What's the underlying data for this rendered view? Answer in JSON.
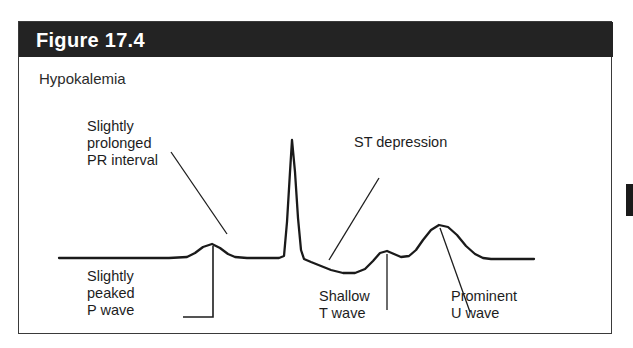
{
  "figure": {
    "title": "Figure 17.4",
    "condition": "Hypokalemia",
    "header_color": "#232323",
    "border_color": "#3a3a3a",
    "background_color": "#ffffff",
    "trace_color": "#1a1a1a",
    "text_color": "#1d1d1d",
    "title_color": "#ffffff"
  },
  "annotations": {
    "pr_interval": "Slightly\nprolonged\nPR interval",
    "st_depression": "ST depression",
    "p_wave": "Slightly\npeaked\nP wave",
    "t_wave": "Shallow\nT wave",
    "u_wave": "Prominent\nU wave"
  },
  "chart_data": {
    "type": "line",
    "title": "Figure 17.4",
    "subtitle": "Hypokalemia",
    "xlabel": "",
    "ylabel": "",
    "grid": false,
    "legend": "none",
    "baseline_y": 236,
    "x_range": [
      40,
      515
    ],
    "series": [
      {
        "name": "ECG tracing (hypokalemia)",
        "points": [
          [
            40,
            236
          ],
          [
            110,
            236
          ],
          [
            150,
            236
          ],
          [
            168,
            235
          ],
          [
            176,
            231
          ],
          [
            184,
            225
          ],
          [
            193,
            222
          ],
          [
            201,
            226
          ],
          [
            209,
            232
          ],
          [
            216,
            235
          ],
          [
            228,
            236
          ],
          [
            248,
            236
          ],
          [
            260,
            236
          ],
          [
            265,
            234
          ],
          [
            268,
            200
          ],
          [
            271,
            150
          ],
          [
            273,
            118
          ],
          [
            276,
            150
          ],
          [
            279,
            196
          ],
          [
            282,
            228
          ],
          [
            285,
            237
          ],
          [
            292,
            240
          ],
          [
            302,
            244
          ],
          [
            312,
            248
          ],
          [
            324,
            251
          ],
          [
            336,
            251
          ],
          [
            346,
            247
          ],
          [
            354,
            239
          ],
          [
            361,
            231
          ],
          [
            368,
            229
          ],
          [
            375,
            232
          ],
          [
            382,
            235
          ],
          [
            390,
            234
          ],
          [
            397,
            228
          ],
          [
            404,
            218
          ],
          [
            412,
            208
          ],
          [
            420,
            203
          ],
          [
            429,
            205
          ],
          [
            438,
            213
          ],
          [
            447,
            224
          ],
          [
            456,
            232
          ],
          [
            464,
            236
          ],
          [
            472,
            237
          ],
          [
            490,
            237
          ],
          [
            515,
            237
          ]
        ]
      }
    ],
    "features": [
      {
        "name": "P wave",
        "x": 193,
        "y": 222,
        "note": "slightly peaked"
      },
      {
        "name": "PR interval",
        "x": 228,
        "y": 236,
        "note": "slightly prolonged"
      },
      {
        "name": "QRS complex",
        "x": 273,
        "y": 118,
        "note": "tall narrow spike"
      },
      {
        "name": "ST segment",
        "x": 324,
        "y": 251,
        "note": "depressed below baseline"
      },
      {
        "name": "T wave",
        "x": 368,
        "y": 229,
        "note": "shallow / flattened"
      },
      {
        "name": "U wave",
        "x": 420,
        "y": 203,
        "note": "prominent"
      }
    ],
    "leader_lines": [
      {
        "name": "pr-interval-leader",
        "type": "diagonal",
        "points": [
          [
            152,
            130
          ],
          [
            208,
            212
          ]
        ]
      },
      {
        "name": "st-depression-leader",
        "type": "diagonal",
        "points": [
          [
            360,
            156
          ],
          [
            310,
            238
          ]
        ]
      },
      {
        "name": "p-wave-leader",
        "type": "elbow",
        "points": [
          [
            194,
            224
          ],
          [
            194,
            295
          ],
          [
            164,
            295
          ]
        ]
      },
      {
        "name": "t-wave-leader",
        "type": "vertical",
        "points": [
          [
            368,
            232
          ],
          [
            368,
            288
          ]
        ]
      },
      {
        "name": "u-wave-leader",
        "type": "diagonal",
        "points": [
          [
            421,
            206
          ],
          [
            451,
            290
          ]
        ]
      }
    ]
  }
}
